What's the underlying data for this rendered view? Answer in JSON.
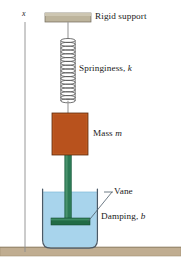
{
  "figure": {
    "background_color": "#ffffff"
  },
  "axis": {
    "label": "x",
    "line_color": "#8d8d8d",
    "x": 25,
    "y_top": 22,
    "y_bottom": 252
  },
  "labels": {
    "rigid_support": "Rigid support",
    "springiness": "Springiness, ",
    "springiness_symbol": "k",
    "mass": "Mass ",
    "mass_symbol": "m",
    "vane": "Vane",
    "damping": "Damping, ",
    "damping_symbol": "b"
  },
  "parts": {
    "support_bar": {
      "name": "rigid-support-bar",
      "fill": "#bdb49c",
      "stroke": "#7a7363",
      "x": 45,
      "y": 13,
      "width": 46,
      "height": 9
    },
    "spring": {
      "name": "spring-coil",
      "stroke": "#4d4d4d",
      "center_x": 68,
      "y_top": 38,
      "y_bottom": 102,
      "coil_width": 15,
      "coils": 17
    },
    "spring_wire_top": {
      "stroke": "#8a8a8a",
      "x": 68,
      "y_top": 22,
      "y_bottom": 38
    },
    "spring_wire_bottom": {
      "stroke": "#8a8a8a",
      "x": 68,
      "y_top": 102,
      "y_bottom": 113
    },
    "mass_block": {
      "name": "mass-block",
      "fill": "#b8521d",
      "stroke": "#6f3512",
      "x": 52,
      "y": 113,
      "width": 36,
      "height": 42
    },
    "rod": {
      "name": "connecting-rod",
      "fill": "#2c7a55",
      "stroke": "#1d5c3e",
      "x": 65,
      "y": 155,
      "width": 7,
      "height": 66
    },
    "vane_bar": {
      "name": "vane-bar",
      "fill": "#216b45",
      "stroke": "#14472e",
      "x": 51,
      "y": 218,
      "width": 39,
      "height": 7
    },
    "container": {
      "name": "liquid-container",
      "stroke": "#4a5a68",
      "x": 42,
      "y": 189,
      "width": 56,
      "height": 60
    },
    "liquid": {
      "name": "damping-liquid",
      "fill": "#a8d4ec",
      "surface_y": 192
    },
    "floor": {
      "name": "ground-floor",
      "fill": "#c0ad91",
      "stroke": "#a09073",
      "x": 0,
      "y": 247,
      "width": 181,
      "height": 9
    },
    "vane_leader": {
      "name": "vane-leader-line",
      "stroke": "#4a5a68",
      "x1": 88,
      "y1": 221,
      "x2": 112,
      "y2": 192
    }
  },
  "label_positions": {
    "axis_x": {
      "left": 22,
      "top": 11
    },
    "rigid_support": {
      "left": 95,
      "top": 13
    },
    "springiness": {
      "left": 79,
      "top": 65
    },
    "mass": {
      "left": 93,
      "top": 130
    },
    "vane": {
      "left": 113,
      "top": 188
    },
    "damping": {
      "left": 101,
      "top": 213
    }
  }
}
